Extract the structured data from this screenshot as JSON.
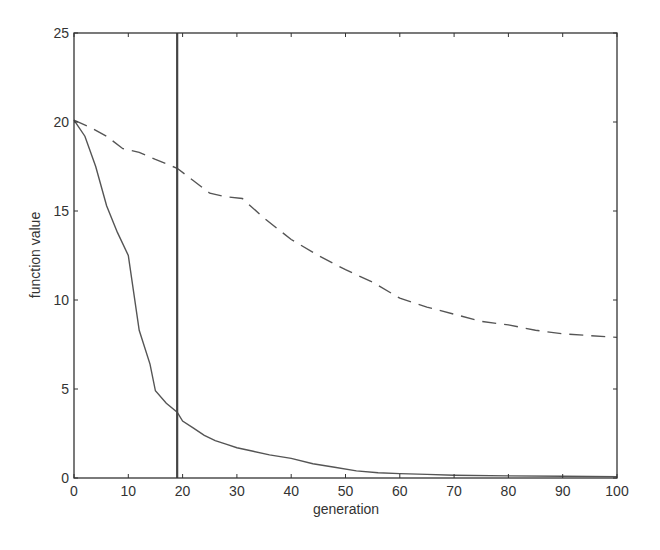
{
  "chart_data": {
    "type": "line",
    "title": "",
    "xlabel": "generation",
    "ylabel": "function value",
    "xlim": [
      0,
      100
    ],
    "ylim": [
      0,
      25
    ],
    "xticks": [
      0,
      10,
      20,
      30,
      40,
      50,
      60,
      70,
      80,
      90,
      100
    ],
    "yticks": [
      0,
      5,
      10,
      15,
      20,
      25
    ],
    "grid": false,
    "legend": null,
    "vertical_marker": {
      "x": 19,
      "style": "solid"
    },
    "series": [
      {
        "name": "solid",
        "style": "solid",
        "x": [
          0,
          2,
          4,
          6,
          8,
          10,
          12,
          14,
          15,
          17,
          19,
          20,
          22,
          24,
          26,
          28,
          30,
          33,
          36,
          40,
          44,
          48,
          52,
          56,
          60,
          65,
          70,
          80,
          90,
          100
        ],
        "y": [
          20.1,
          19.2,
          17.5,
          15.3,
          13.8,
          12.5,
          8.3,
          6.4,
          4.9,
          4.2,
          3.7,
          3.2,
          2.8,
          2.4,
          2.1,
          1.9,
          1.7,
          1.5,
          1.3,
          1.1,
          0.8,
          0.6,
          0.4,
          0.3,
          0.25,
          0.2,
          0.15,
          0.12,
          0.1,
          0.08
        ]
      },
      {
        "name": "dashed",
        "style": "dashed",
        "x": [
          0,
          3,
          6,
          9,
          12,
          15,
          19,
          22,
          25,
          28,
          31,
          35,
          40,
          45,
          50,
          55,
          60,
          65,
          70,
          75,
          80,
          85,
          90,
          95,
          100
        ],
        "y": [
          20.1,
          19.7,
          19.2,
          18.5,
          18.3,
          17.9,
          17.4,
          16.7,
          16.0,
          15.8,
          15.7,
          14.6,
          13.4,
          12.5,
          11.7,
          11.0,
          10.1,
          9.6,
          9.2,
          8.8,
          8.6,
          8.3,
          8.1,
          8.0,
          7.9
        ]
      }
    ]
  }
}
